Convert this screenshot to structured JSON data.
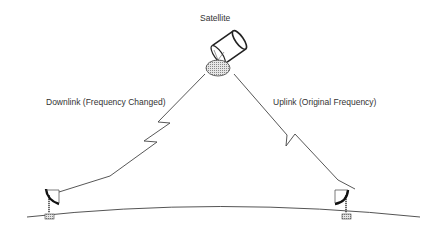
{
  "diagram": {
    "type": "satellite-relay",
    "labels": {
      "satellite": "Satellite",
      "downlink": "Downlink (Frequency Changed)",
      "uplink": "Uplink (Original Frequency)"
    },
    "nodes": [
      {
        "id": "satellite",
        "icon": "satellite-icon"
      },
      {
        "id": "left-dish",
        "icon": "ground-dish-icon",
        "role": "receiver"
      },
      {
        "id": "right-dish",
        "icon": "ground-dish-icon",
        "role": "transmitter"
      }
    ],
    "edges": [
      {
        "from": "satellite",
        "to": "left-dish",
        "label": "Downlink (Frequency Changed)",
        "style": "lightning"
      },
      {
        "from": "right-dish",
        "to": "satellite",
        "label": "Uplink (Original Frequency)",
        "style": "lightning"
      }
    ],
    "colors": {
      "stroke": "#333333",
      "text": "#333333",
      "background": "#ffffff"
    }
  }
}
